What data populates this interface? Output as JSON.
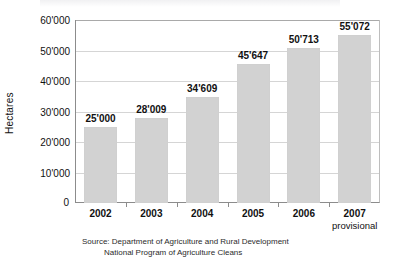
{
  "chart_data": {
    "type": "bar",
    "title": "",
    "xlabel": "",
    "ylabel": "Hectares",
    "categories": [
      "2002",
      "2003",
      "2004",
      "2005",
      "2006",
      "2007"
    ],
    "category_sublabels": [
      "",
      "",
      "",
      "",
      "",
      "provisional"
    ],
    "values": [
      25000,
      28009,
      34609,
      45647,
      50713,
      55072
    ],
    "value_labels": [
      "25'000",
      "28'009",
      "34'609",
      "45'647",
      "50'713",
      "55'072"
    ],
    "ylim": [
      0,
      60000
    ],
    "ytick_values": [
      0,
      10000,
      20000,
      30000,
      40000,
      50000,
      60000
    ],
    "ytick_labels": [
      "0",
      "10'000",
      "20'000",
      "30'000",
      "40'000",
      "50'000",
      "60'000"
    ],
    "grid": true,
    "legend": false,
    "bar_color": "#d2d2d2",
    "axis_color": "#8c8c8c",
    "grid_color": "#d5d5d5",
    "text_color": "#111111",
    "background": "#ffffff"
  },
  "source_note": {
    "line1": "Source: Department of Agriculture and Rural Development",
    "line2": "National Program of Agriculture Cleans"
  }
}
